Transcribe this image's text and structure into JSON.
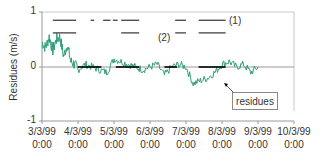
{
  "chart_data": {
    "type": "line",
    "title": "",
    "xlabel": "",
    "ylabel": "Residues (m/s)",
    "ylim": [
      -1,
      1
    ],
    "yticks": [
      "1",
      "0",
      "-1"
    ],
    "xticks": [
      {
        "date": "3/3/99",
        "time": "0:00"
      },
      {
        "date": "4/3/99",
        "time": "0:00"
      },
      {
        "date": "5/3/99",
        "time": "0:00"
      },
      {
        "date": "6/3/99",
        "time": "0:00"
      },
      {
        "date": "7/3/99",
        "time": "0:00"
      },
      {
        "date": "8/3/99",
        "time": "0:00"
      },
      {
        "date": "9/3/99",
        "time": "0:00"
      },
      {
        "date": "10/3/99",
        "time": "0:00"
      }
    ],
    "grid": false,
    "annotations": [
      {
        "text": "(1)",
        "type": "series-label"
      },
      {
        "text": "(2)",
        "type": "series-label"
      },
      {
        "text": "residues",
        "type": "callout"
      }
    ],
    "series": [
      {
        "name": "residues",
        "color": "#2e9e78",
        "description": "Noisy residual time series; ~0.3-0.6 m/s in early March, near 0 through April, slightly positive in May, dipping to about -0.2 to -0.35 in late June–July, back near 0 in August.",
        "x_months": [
          0.0,
          0.1,
          0.2,
          0.3,
          0.4,
          0.5,
          0.6,
          0.7,
          0.8,
          0.9,
          1.0,
          1.2,
          1.4,
          1.6,
          1.8,
          2.0,
          2.2,
          2.4,
          2.6,
          2.8,
          3.0,
          3.2,
          3.4,
          3.6,
          3.8,
          4.0,
          4.2,
          4.4,
          4.6,
          4.8,
          5.0,
          5.2,
          5.4,
          5.6,
          5.8,
          6.0
        ],
        "values": [
          0.45,
          0.35,
          0.55,
          0.3,
          0.5,
          0.55,
          0.2,
          0.4,
          0.1,
          0.05,
          -0.05,
          0.05,
          0.0,
          -0.05,
          -0.1,
          0.15,
          0.1,
          0.05,
          0.0,
          -0.05,
          0.0,
          0.05,
          -0.15,
          0.0,
          0.05,
          0.0,
          -0.3,
          -0.25,
          -0.2,
          -0.1,
          0.05,
          0.1,
          0.0,
          0.05,
          -0.1,
          0.0
        ]
      },
      {
        "name": "(1) upper interval bars",
        "color": "#333333",
        "value": 0.85,
        "segments_months": [
          [
            0.3,
            0.95
          ],
          [
            1.35,
            1.45
          ],
          [
            1.7,
            1.9
          ],
          [
            1.97,
            2.1
          ],
          [
            2.2,
            2.7
          ],
          [
            3.7,
            4.0
          ],
          [
            4.35,
            5.1
          ]
        ]
      },
      {
        "name": "(2) lower interval bars",
        "color": "#333333",
        "value": 0.62,
        "segments_months": [
          [
            0.3,
            0.95
          ],
          [
            2.2,
            2.7
          ],
          [
            3.7,
            4.0
          ],
          [
            4.35,
            5.1
          ]
        ]
      },
      {
        "name": "zero-level markers",
        "color": "#000000",
        "value": 0,
        "segments_months": [
          [
            1.0,
            1.65
          ],
          [
            2.05,
            2.7
          ],
          [
            3.4,
            3.75
          ],
          [
            4.35,
            5.1
          ]
        ]
      }
    ],
    "legend_position": "inline"
  },
  "labels": {
    "ylabel": "Residues (m/s)",
    "y1": "1",
    "y0": "0",
    "ym1": "-1",
    "series1": "(1)",
    "series2": "(2)",
    "callout": "residues"
  }
}
